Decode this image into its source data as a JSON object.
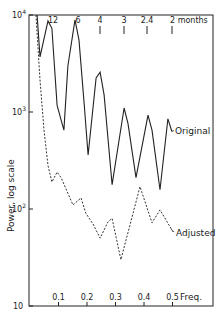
{
  "chart_data": {
    "type": "line",
    "title": "",
    "xlabel": "Freq.",
    "ylabel": "Power, log scale",
    "yscale": "log",
    "xlim": [
      0,
      0.56
    ],
    "ylim": [
      10,
      10000
    ],
    "x_ticks": [
      0.1,
      0.2,
      0.3,
      0.4,
      0.5
    ],
    "x_tick_labels": [
      "0.1",
      "0.2",
      "0.3",
      "0.4",
      "0.5"
    ],
    "y_ticks": [
      10,
      100,
      1000,
      10000
    ],
    "y_tick_labels": [
      {
        "base": "10",
        "exp": ""
      },
      {
        "base": "10",
        "exp": "2"
      },
      {
        "base": "10",
        "exp": "3"
      },
      {
        "base": "10",
        "exp": "4"
      }
    ],
    "top_axis": {
      "label": "months",
      "ticks": [
        {
          "label": "12",
          "freq": 0.083,
          "tick": false
        },
        {
          "label": "6",
          "freq": 0.167,
          "tick": false
        },
        {
          "label": "4",
          "freq": 0.25,
          "tick": true
        },
        {
          "label": "3",
          "freq": 0.333,
          "tick": true
        },
        {
          "label": "2.4",
          "freq": 0.417,
          "tick": true
        },
        {
          "label": "2 months",
          "freq": 0.5,
          "tick": true
        }
      ]
    },
    "grid": false,
    "legend": "inline labels at right end of each series",
    "series": [
      {
        "name": "Original",
        "style": "solid",
        "x": [
          0.025,
          0.035,
          0.063,
          0.077,
          0.095,
          0.119,
          0.133,
          0.158,
          0.172,
          0.19,
          0.204,
          0.232,
          0.246,
          0.26,
          0.288,
          0.33,
          0.344,
          0.372,
          0.414,
          0.428,
          0.456,
          0.484,
          0.498
        ],
        "y": [
          10000,
          3700,
          8700,
          7300,
          1170,
          650,
          3000,
          8900,
          5500,
          1200,
          360,
          2240,
          2580,
          1500,
          178,
          1100,
          760,
          210,
          930,
          650,
          158,
          850,
          630
        ]
      },
      {
        "name": "Adjusted",
        "style": "dashed",
        "x": [
          0.021,
          0.035,
          0.049,
          0.063,
          0.077,
          0.095,
          0.109,
          0.151,
          0.179,
          0.196,
          0.221,
          0.246,
          0.274,
          0.288,
          0.319,
          0.386,
          0.428,
          0.456,
          0.502
        ],
        "y": [
          10000,
          2140,
          650,
          280,
          190,
          240,
          210,
          110,
          130,
          90,
          70,
          50,
          74,
          80,
          30,
          170,
          72,
          98,
          58
        ]
      }
    ]
  }
}
